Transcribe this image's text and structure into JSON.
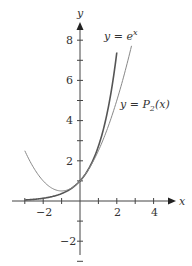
{
  "chart_data": {
    "type": "line",
    "title": "",
    "xlabel": "x",
    "ylabel": "y",
    "xlim": [
      -3.7,
      5.0
    ],
    "ylim": [
      -3.0,
      8.8
    ],
    "x_ticks": [
      -3,
      -2,
      -1,
      0,
      1,
      2,
      3,
      4
    ],
    "x_tick_labels": [
      "-2",
      "2",
      "4"
    ],
    "x_tick_label_values": [
      -2,
      2,
      4
    ],
    "y_ticks": [
      -3,
      -2,
      -1,
      1,
      2,
      3,
      4,
      5,
      6,
      7,
      8
    ],
    "y_tick_labels": [
      "8",
      "6",
      "4",
      "2",
      "-2"
    ],
    "y_tick_label_values": [
      8,
      6,
      4,
      2,
      -2
    ],
    "grid": false,
    "series": [
      {
        "name": "y = e^x",
        "formula": "e^x",
        "x_range": [
          -3,
          2
        ],
        "color": "#555555",
        "stroke_width": 1.6,
        "x": [
          -3,
          -2,
          -1,
          0,
          1,
          1.5,
          2
        ],
        "values": [
          0.05,
          0.14,
          0.37,
          1.0,
          2.72,
          4.48,
          7.39
        ]
      },
      {
        "name": "y = P2(x)",
        "formula": "1 + x + x^2/2",
        "x_range": [
          -3,
          2.8
        ],
        "color": "#888888",
        "stroke_width": 1.0,
        "x": [
          -3,
          -2,
          -1,
          0,
          1,
          2,
          2.8
        ],
        "values": [
          2.5,
          1.0,
          0.5,
          1.0,
          2.5,
          5.0,
          7.72
        ]
      }
    ],
    "annotations": [
      {
        "text": "y = e^x",
        "near": "top of e^x curve"
      },
      {
        "text": "y = P2(x)",
        "near": "right of P2 curve at y≈4.5"
      }
    ]
  },
  "labels": {
    "x_axis": "x",
    "y_axis": "y",
    "ex_label_prefix": "y = e",
    "ex_label_sup": "x",
    "p2_label_prefix": "y = P",
    "p2_label_sub": "2",
    "p2_label_suffix": "(x)",
    "tick_neg2_x": "−2",
    "tick_2_x": "2",
    "tick_4_x": "4",
    "tick_8_y": "8",
    "tick_6_y": "6",
    "tick_4_y": "4",
    "tick_2_y": "2",
    "tick_neg2_y": "−2"
  }
}
